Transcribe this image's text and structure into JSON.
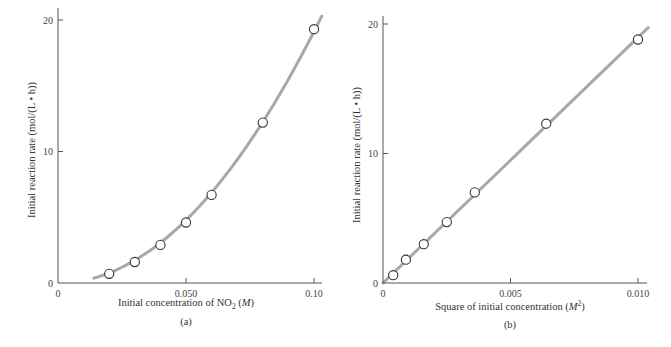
{
  "chart_data": [
    {
      "id": "a",
      "type": "line",
      "title": "",
      "panel_label": "(a)",
      "xlabel": "Initial concentration of NO2 (M)",
      "xlabel_parts": {
        "pre": "Initial concentration of NO",
        "sub": "2",
        "post": " (",
        "italic": "M",
        "end": ")"
      },
      "ylabel": "Initial reaction rate (mol/(L • h))",
      "xlim": [
        0,
        0.1
      ],
      "ylim": [
        0,
        20
      ],
      "xticks": [
        0,
        0.05,
        0.1
      ],
      "xtick_labels": [
        "0",
        "0.050",
        "0.10"
      ],
      "yticks": [
        0,
        10,
        20
      ],
      "ytick_labels": [
        "0",
        "10",
        "20"
      ],
      "grid": false,
      "legend": null,
      "series": [
        {
          "name": "measured",
          "style": "open-circle markers",
          "x": [
            0.02,
            0.03,
            0.04,
            0.05,
            0.06,
            0.08,
            0.1
          ],
          "y": [
            0.7,
            1.6,
            2.9,
            4.6,
            6.7,
            12.2,
            19.3
          ]
        },
        {
          "name": "fit curve (quadratic)",
          "style": "thick gray smooth curve",
          "x_range": [
            0.014,
            0.103
          ]
        }
      ]
    },
    {
      "id": "b",
      "type": "line",
      "title": "",
      "panel_label": "(b)",
      "xlabel": "Square of initial concentration (M^2)",
      "xlabel_parts": {
        "pre": "Square of initial concentration (",
        "italic": "M",
        "sup": "2",
        "end": ")"
      },
      "ylabel": "Initial reaction rate (mol/(L • h))",
      "xlim": [
        0,
        0.01
      ],
      "ylim": [
        0,
        20
      ],
      "xticks": [
        0,
        0.005,
        0.01
      ],
      "xtick_labels": [
        "0",
        "0.005",
        "0.010"
      ],
      "yticks": [
        0,
        10,
        20
      ],
      "ytick_labels": [
        "0",
        "10",
        "20"
      ],
      "grid": false,
      "legend": null,
      "series": [
        {
          "name": "measured",
          "style": "open-circle markers",
          "x": [
            0.0004,
            0.0009,
            0.0016,
            0.0025,
            0.0036,
            0.0064,
            0.01
          ],
          "y": [
            0.6,
            1.8,
            3.0,
            4.7,
            7.0,
            12.3,
            18.8
          ]
        },
        {
          "name": "linear fit",
          "style": "thick gray straight line",
          "x_range": [
            0,
            0.0104
          ]
        }
      ]
    }
  ]
}
